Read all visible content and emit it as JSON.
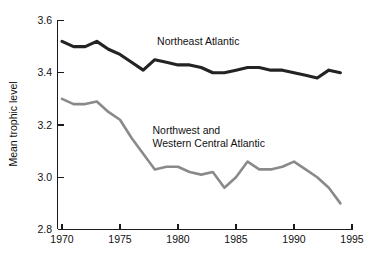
{
  "chart_data": {
    "type": "line",
    "title": "",
    "xlabel": "",
    "ylabel": "Mean trophic level",
    "xlim": [
      1970,
      1995
    ],
    "ylim": [
      2.8,
      3.6
    ],
    "grid": false,
    "legend_position": "inline-annotation",
    "x_ticks": [
      "1970",
      "1975",
      "1980",
      "1985",
      "1990",
      "1995"
    ],
    "x_tick_values": [
      1970,
      1975,
      1980,
      1985,
      1990,
      1995
    ],
    "y_ticks": [
      "2.8",
      "3.0",
      "3.2",
      "3.4",
      "3.6"
    ],
    "y_tick_values": [
      2.8,
      3.0,
      3.2,
      3.4,
      3.6
    ],
    "x": [
      1970,
      1971,
      1972,
      1973,
      1974,
      1975,
      1976,
      1977,
      1978,
      1979,
      1980,
      1981,
      1982,
      1983,
      1984,
      1985,
      1986,
      1987,
      1988,
      1989,
      1990,
      1991,
      1992,
      1993,
      1994
    ],
    "series": [
      {
        "name": "Northeast Atlantic",
        "color": "#232323",
        "values": [
          3.52,
          3.5,
          3.5,
          3.52,
          3.49,
          3.47,
          3.44,
          3.41,
          3.45,
          3.44,
          3.43,
          3.43,
          3.42,
          3.4,
          3.4,
          3.41,
          3.42,
          3.42,
          3.41,
          3.41,
          3.4,
          3.39,
          3.38,
          3.41,
          3.4
        ]
      },
      {
        "name": "Northwest and Western Central Atlantic",
        "color": "#8a8a8a",
        "values": [
          3.3,
          3.28,
          3.28,
          3.29,
          3.25,
          3.22,
          3.15,
          3.09,
          3.03,
          3.04,
          3.04,
          3.02,
          3.01,
          3.02,
          2.96,
          3.0,
          3.06,
          3.03,
          3.03,
          3.04,
          3.06,
          3.03,
          3.0,
          2.96,
          2.9
        ]
      }
    ],
    "annotations": [
      {
        "id": "northeast-atlantic-label",
        "text": "Northeast Atlantic",
        "lines": [
          "Northeast Atlantic"
        ],
        "x": 1978.2,
        "y": 3.505
      },
      {
        "id": "northwest-western-central-atlantic-label",
        "text": "Northwest and Western Central Atlantic",
        "lines": [
          "Northwest and",
          "Western Central Atlantic"
        ],
        "x": 1977.8,
        "y": 3.165
      }
    ]
  }
}
